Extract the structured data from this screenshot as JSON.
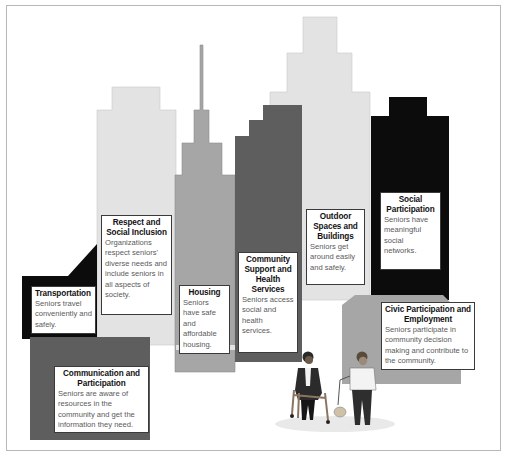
{
  "colors": {
    "light_gray": "#e3e3e3",
    "mid_gray": "#a6a6a6",
    "dark_gray": "#5e5e5e",
    "black": "#0c0c0c",
    "frame_border": "#b8b8b8",
    "box_border": "#3a3a3a"
  },
  "domains": [
    {
      "id": "transportation",
      "title": "Transportation",
      "description": "Seniors travel conveniently and safely."
    },
    {
      "id": "respect-social-inclusion",
      "title": "Respect and Social Inclusion",
      "description": "Organizations respect seniors' diverse needs and include seniors in all aspects of society."
    },
    {
      "id": "housing",
      "title": "Housing",
      "description": "Seniors have safe and affordable housing."
    },
    {
      "id": "community-support-health",
      "title": "Community Support and Health Services",
      "description": "Seniors access social and health services."
    },
    {
      "id": "outdoor-spaces",
      "title": "Outdoor Spaces and Buildings",
      "description": "Seniors get around easily and safely."
    },
    {
      "id": "social-participation",
      "title": "Social Participation",
      "description": "Seniors have meaningful social networks."
    },
    {
      "id": "communication-participation",
      "title": "Communication and Participation",
      "description": "Seniors are aware of resources in the community and get the information they need."
    },
    {
      "id": "civic-participation",
      "title": "Civic Participation and Employment",
      "description": "Seniors participate in community decision making and contribute to the community."
    }
  ],
  "illustration": {
    "figures": [
      "senior-with-walker",
      "senior-walking-dog"
    ]
  }
}
